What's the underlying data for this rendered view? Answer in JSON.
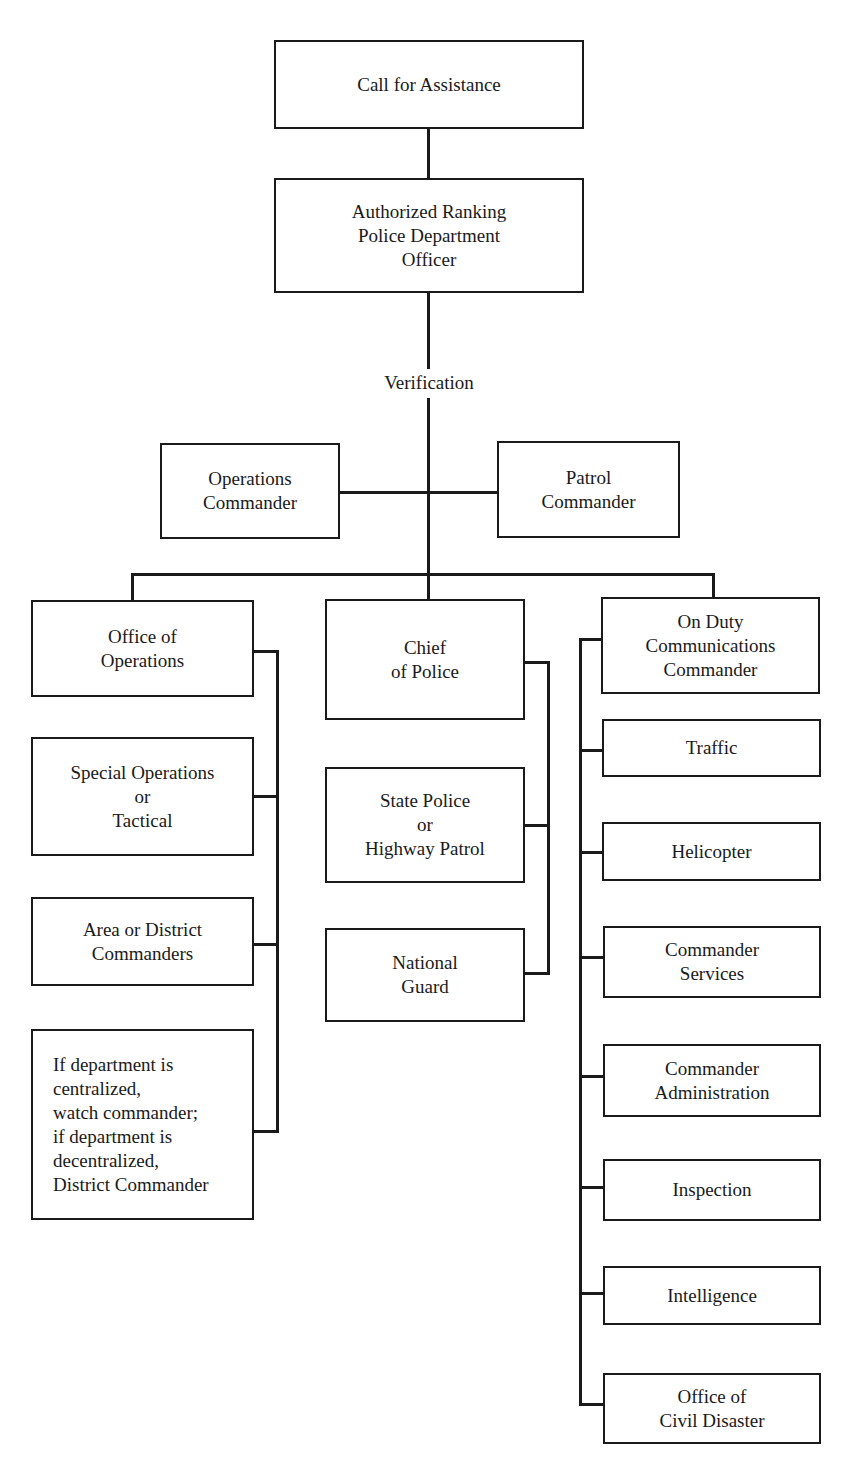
{
  "diagram": {
    "type": "organizational-flowchart",
    "top": {
      "call": "Call for Assistance",
      "officer": "Authorized Ranking\nPolice Department\nOfficer",
      "verification_label": "Verification"
    },
    "commanders": {
      "operations": "Operations\nCommander",
      "patrol": "Patrol\nCommander"
    },
    "left_column": {
      "head": "Office of\nOperations",
      "items": [
        "Special Operations\nor\nTactical",
        "Area or District\nCommanders",
        "If department is\ncentralized,\nwatch commander;\nif department is\ndecentralized,\nDistrict Commander"
      ]
    },
    "center_column": {
      "head": "Chief\nof Police",
      "items": [
        "State Police\nor\nHighway Patrol",
        "National\nGuard"
      ]
    },
    "right_column": {
      "head": "On Duty\nCommunications\nCommander",
      "items": [
        "Traffic",
        "Helicopter",
        "Commander\nServices",
        "Commander\nAdministration",
        "Inspection",
        "Intelligence",
        "Office of\nCivil Disaster"
      ]
    },
    "colors": {
      "ink": "#1a1a1a",
      "paper": "#ffffff"
    }
  }
}
